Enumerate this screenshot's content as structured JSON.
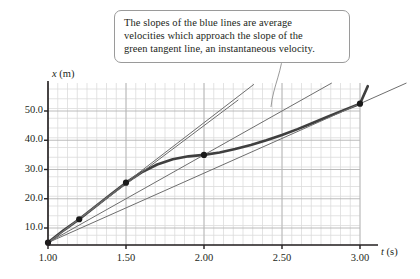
{
  "figure": {
    "callout": {
      "line1": "The slopes of the blue lines are average",
      "line2": "velocities which approach the slope of the",
      "line3": "green tangent line, an instantaneous velocity."
    },
    "axis": {
      "y_label_var": "x",
      "y_label_unit": "(m)",
      "x_label_var": "t",
      "x_label_unit": "(s)"
    }
  },
  "chart_data": {
    "type": "line",
    "title": "",
    "xlabel": "t (s)",
    "ylabel": "x (m)",
    "xlim": [
      1.0,
      3.0
    ],
    "ylim": [
      0.0,
      60.0
    ],
    "grid": true,
    "legend": false,
    "xticks": [
      "1.00",
      "1.50",
      "2.00",
      "2.50",
      "3.00"
    ],
    "xtick_values": [
      1.0,
      1.5,
      2.0,
      2.5,
      3.0
    ],
    "yticks": [
      "10.0",
      "20.0",
      "30.0",
      "40.0",
      "50.0"
    ],
    "ytick_values": [
      10.0,
      20.0,
      30.0,
      40.0,
      50.0
    ],
    "minor_grid_step_x": 0.0625,
    "minor_grid_step_y": 3.4188,
    "series": [
      {
        "name": "position curve",
        "type": "curve",
        "color": "#3f3f3f",
        "width": 2.6,
        "x": [
          1.0,
          1.1,
          1.2,
          1.3,
          1.4,
          1.5,
          1.6,
          1.7,
          1.8,
          1.9,
          2.0,
          2.1,
          2.2,
          2.3,
          2.4,
          2.5,
          2.6,
          2.7,
          2.8,
          2.9,
          3.0,
          3.05
        ],
        "y": [
          5.0,
          9.2,
          13.0,
          17.2,
          21.4,
          25.5,
          29.0,
          31.7,
          33.5,
          34.5,
          35.0,
          35.8,
          37.0,
          38.4,
          40.0,
          41.8,
          43.8,
          46.0,
          48.2,
          50.4,
          52.5,
          58.5
        ]
      },
      {
        "name": "secant-line-1",
        "type": "secant",
        "color": "#6e6e6e",
        "width": 1.0,
        "from": [
          1.0,
          5.0
        ],
        "to": [
          3.0,
          52.5
        ],
        "extend_to_x": 3.3
      },
      {
        "name": "secant-line-2",
        "type": "secant",
        "color": "#6e6e6e",
        "width": 1.0,
        "from": [
          1.0,
          5.0
        ],
        "to": [
          2.0,
          35.0
        ],
        "extend_to_x": 2.85
      },
      {
        "name": "secant-line-3",
        "type": "secant",
        "color": "#6e6e6e",
        "width": 1.0,
        "from": [
          1.0,
          5.0
        ],
        "to": [
          1.5,
          25.5
        ],
        "extend_to_x": 2.32
      },
      {
        "name": "tangent-line",
        "type": "tangent",
        "color": "#6e6e6e",
        "width": 1.0,
        "from": [
          1.0,
          5.0
        ],
        "to": [
          1.2,
          13.0
        ],
        "extend_to_x": 2.22
      }
    ],
    "points": [
      {
        "label": "p0",
        "x": 1.0,
        "y": 5.0
      },
      {
        "label": "p1",
        "x": 1.2,
        "y": 13.0
      },
      {
        "label": "p2",
        "x": 1.5,
        "y": 25.5
      },
      {
        "label": "p3",
        "x": 2.0,
        "y": 35.0
      },
      {
        "label": "p4",
        "x": 3.0,
        "y": 52.5
      }
    ],
    "colors": {
      "axis": "#231f20",
      "grid_minor": "#dcdcdc",
      "grid_major": "#b4b4b4",
      "curve": "#3f3f3f",
      "secant": "#6e6e6e",
      "marker": "#1a1a1a",
      "callout_border": "#9a9a9a",
      "text": "#231f20"
    }
  }
}
